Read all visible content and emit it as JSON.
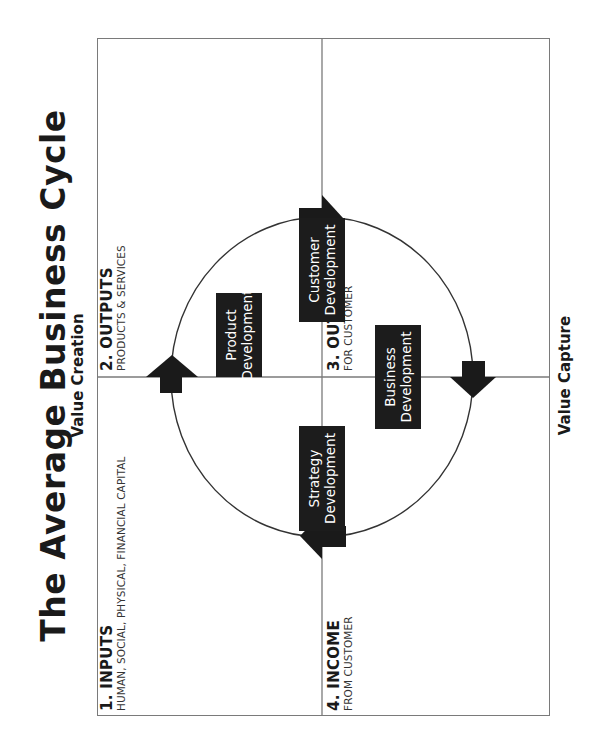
{
  "title": "The Average Business Cycle",
  "axes": {
    "top": "Value Creation",
    "bottom": "Value Capture"
  },
  "quadrants": [
    {
      "id": "inputs",
      "heading": "1. INPUTS",
      "subheading": "HUMAN, SOCIAL, PHYSICAL, FINANCIAL CAPITAL"
    },
    {
      "id": "outputs",
      "heading": "2. OUTPUTS",
      "subheading": "PRODUCTS & SERVICES"
    },
    {
      "id": "outcomes",
      "heading": "3. OUTCOMES",
      "subheading": "FOR CUSTOMER"
    },
    {
      "id": "income",
      "heading": "4. INCOME",
      "subheading": "FROM CUSTOMER"
    }
  ],
  "boxes": [
    {
      "id": "product",
      "line1": "Product",
      "line2": "Development"
    },
    {
      "id": "customer",
      "line1": "Customer",
      "line2": "Development"
    },
    {
      "id": "business",
      "line1": "Business",
      "line2": "Development"
    },
    {
      "id": "strategy",
      "line1": "Strategy",
      "line2": "Development"
    }
  ],
  "cycle": {
    "direction": "clockwise",
    "arrows": [
      "inputs-to-outputs",
      "outputs-to-outcomes",
      "outcomes-to-income",
      "income-to-inputs"
    ]
  },
  "colors": {
    "ink": "#1a1a1a",
    "box_fill": "#1c1c1c",
    "frame": "#7a7a7a",
    "background": "#ffffff"
  },
  "orientation": "rotated -90deg (reads bottom-to-top)"
}
